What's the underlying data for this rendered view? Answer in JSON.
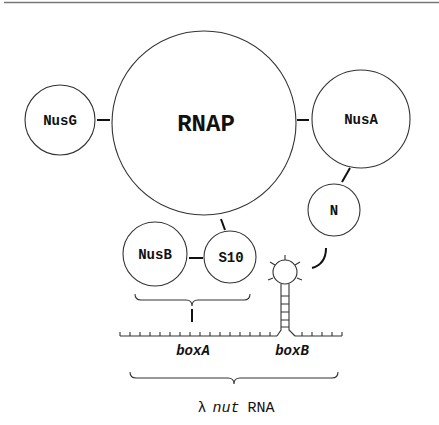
{
  "diagram": {
    "nodes": {
      "rnap": {
        "label": "RNAP"
      },
      "nusg": {
        "label": "NusG"
      },
      "nusa": {
        "label": "NusA"
      },
      "n": {
        "label": "N"
      },
      "nusb": {
        "label": "NusB"
      },
      "s10": {
        "label": "S10"
      }
    },
    "rna": {
      "box_a": "boxA",
      "box_b": "boxB",
      "caption_symbol": "λ",
      "caption_italic": "nut",
      "caption_rest": "RNA"
    },
    "colors": {
      "stroke": "#333333",
      "text": "#111111",
      "rule": "#777777",
      "background": "#ffffff"
    }
  }
}
